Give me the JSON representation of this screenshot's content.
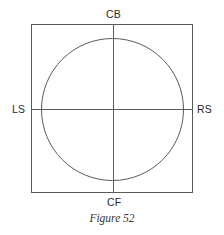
{
  "figure": {
    "labels": {
      "top": "CB",
      "bottom": "CF",
      "left": "LS",
      "right": "RS"
    },
    "caption": "Figure 52",
    "colors": {
      "line": "#5a5a5a",
      "text": "#2a2a2a",
      "background": "#ffffff"
    }
  }
}
